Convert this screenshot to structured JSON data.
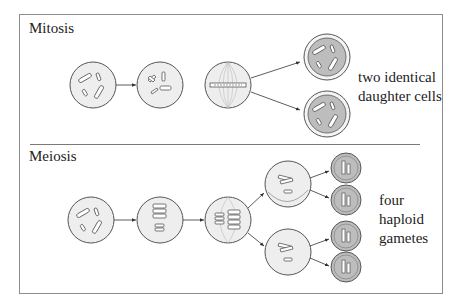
{
  "figure": {
    "sections": [
      {
        "id": "mitosis",
        "title": "Mitosis",
        "caption": [
          "two identical",
          "daughter cells"
        ],
        "stages": [
          "parent cell with chromosomes",
          "chromosomes condensed",
          "metaphase alignment on spindle",
          "two daughter cells"
        ]
      },
      {
        "id": "meiosis",
        "title": "Meiosis",
        "caption": [
          "four",
          "haploid",
          "gametes"
        ],
        "stages": [
          "parent cell with chromosomes",
          "homologous pairs",
          "metaphase I alignment",
          "two intermediate cells",
          "four gametes"
        ]
      }
    ],
    "colors": {
      "cell_fill": "#eeeeee",
      "daughter_fill": "#bdbdbd",
      "outline": "#555555",
      "frame": "#8c8c8c"
    }
  }
}
